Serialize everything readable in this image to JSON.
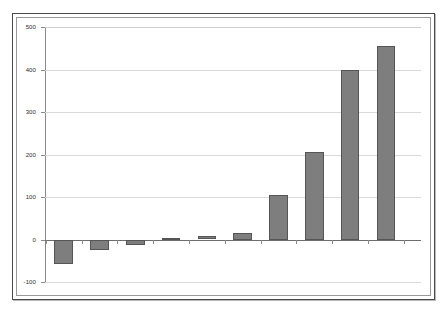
{
  "chart_data": {
    "type": "bar",
    "title": "",
    "subtitle": "",
    "xlabel": "",
    "ylabel": "",
    "categories": [
      "1",
      "2",
      "3",
      "4",
      "5",
      "6",
      "7",
      "8",
      "9",
      "10"
    ],
    "values": [
      -58,
      -25,
      -13,
      4,
      8,
      15,
      105,
      205,
      400,
      455
    ],
    "series": [
      {
        "name": "series-1",
        "values": [
          -58,
          -25,
          -13,
          4,
          8,
          15,
          105,
          205,
          400,
          455
        ]
      }
    ],
    "ylim": [
      -100,
      500
    ],
    "yticks": [
      -100,
      0,
      100,
      200,
      300,
      400,
      500
    ],
    "ytick_labels": [
      "-100",
      "0",
      "100",
      "200",
      "300",
      "400",
      "500"
    ],
    "xtick_labels": [
      "",
      "",
      "",
      "",
      "",
      "",
      "",
      "",
      "",
      ""
    ],
    "grid": true,
    "grid_axis": "y",
    "legend": false,
    "legend_position": "none",
    "bar_color": "#7e7e7e",
    "bar_edge_color": "#555555",
    "zero_line_color": "#6d6d6d",
    "gridline_color": "#d9d9d9",
    "axis_color": "#8a8a8a",
    "plot_background": "#ffffff",
    "frame_color": "#4a4a4a",
    "annotations": []
  }
}
